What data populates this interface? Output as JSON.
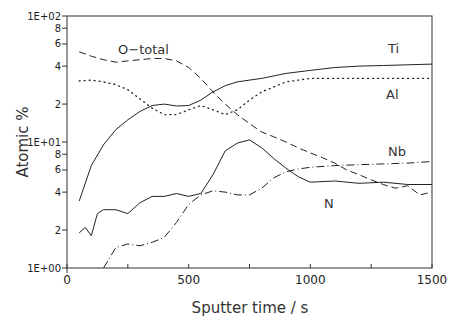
{
  "chart_data": {
    "type": "line",
    "title": "",
    "xlabel": "Sputter time / s",
    "ylabel": "Atomic %",
    "xlim": [
      0,
      1500
    ],
    "ylim": [
      1,
      100
    ],
    "yscale": "log",
    "grid": false,
    "legend": "inline labels",
    "x_ticks": [
      0,
      500,
      1000,
      1500
    ],
    "x_tick_labels": [
      "0",
      "500",
      "1000",
      "1500"
    ],
    "y_ticks": [
      1,
      2,
      4,
      6,
      8,
      10,
      20,
      40,
      60,
      80,
      100
    ],
    "y_tick_labels": [
      "1E+00",
      "2",
      "4",
      "6",
      "8",
      "1E+01",
      "2",
      "4",
      "6",
      "8",
      "1E+02"
    ],
    "series": [
      {
        "name": "O-total",
        "style": "dashed",
        "label_pos": [
          150,
          55
        ],
        "x": [
          50,
          100,
          150,
          200,
          250,
          300,
          350,
          400,
          450,
          500,
          550,
          600,
          650,
          700,
          750,
          800,
          850,
          900,
          950,
          1000,
          1050,
          1100,
          1150,
          1200,
          1250,
          1300,
          1350,
          1400,
          1450,
          1500
        ],
        "values": [
          52,
          48,
          45,
          43,
          44,
          45,
          46,
          46,
          44,
          39,
          32,
          25,
          20,
          16.5,
          14,
          12,
          11,
          10,
          9,
          8.2,
          7.5,
          6.8,
          6,
          5.5,
          5,
          4.6,
          4.3,
          4.5,
          3.8,
          4.0
        ]
      },
      {
        "name": "Ti",
        "style": "solid",
        "label_pos": [
          1340,
          55
        ],
        "x": [
          50,
          100,
          150,
          200,
          250,
          300,
          350,
          400,
          450,
          500,
          550,
          600,
          650,
          700,
          750,
          800,
          900,
          1000,
          1100,
          1200,
          1300,
          1400,
          1500
        ],
        "values": [
          3.4,
          6.5,
          9.5,
          12.5,
          15,
          17.5,
          19.5,
          20,
          19.3,
          19.5,
          21.5,
          25,
          28,
          30,
          31,
          32,
          35,
          37,
          39,
          40,
          40.5,
          41,
          41.5
        ]
      },
      {
        "name": "Al",
        "style": "dotted",
        "label_pos": [
          1340,
          29
        ],
        "x": [
          50,
          100,
          150,
          200,
          250,
          300,
          350,
          400,
          450,
          500,
          550,
          600,
          650,
          700,
          750,
          800,
          900,
          1000,
          1100,
          1200,
          1300,
          1400,
          1500
        ],
        "values": [
          30.5,
          31,
          30,
          28.5,
          26,
          22,
          18.5,
          16.5,
          16.5,
          18,
          19.5,
          18,
          16.5,
          18,
          21.5,
          25,
          30,
          32,
          32,
          32,
          32,
          32,
          32
        ]
      },
      {
        "name": "Nb",
        "style": "solid",
        "label_pos": [
          1350,
          11.5
        ],
        "x": [
          50,
          75,
          100,
          125,
          150,
          200,
          250,
          300,
          350,
          400,
          450,
          500,
          550,
          600,
          650,
          700,
          750,
          800,
          850,
          900,
          950,
          1000,
          1100,
          1200,
          1300,
          1400,
          1500
        ],
        "values": [
          1.9,
          2.1,
          1.8,
          2.7,
          2.9,
          2.9,
          2.7,
          3.3,
          3.7,
          3.7,
          3.9,
          3.7,
          3.9,
          5.5,
          8.5,
          9.8,
          10.4,
          9.0,
          7.4,
          6.2,
          5.3,
          4.8,
          4.9,
          4.7,
          4.8,
          4.6,
          4.6
        ]
      },
      {
        "name": "N",
        "style": "dash-dot",
        "label_pos": [
          1150,
          3.2
        ],
        "x": [
          150,
          175,
          200,
          250,
          300,
          350,
          400,
          450,
          500,
          550,
          600,
          650,
          700,
          750,
          800,
          850,
          900,
          950,
          1000,
          1100,
          1200,
          1300,
          1400,
          1500
        ],
        "values": [
          1.0,
          1.2,
          1.45,
          1.55,
          1.5,
          1.6,
          1.75,
          2.3,
          3.2,
          3.8,
          4.1,
          4.0,
          3.8,
          3.8,
          4.3,
          5.2,
          5.8,
          6.1,
          6.3,
          6.5,
          6.6,
          6.7,
          6.8,
          7.0
        ]
      }
    ]
  },
  "labels": {
    "o_total": "O−total",
    "ti": "Ti",
    "al": "Al",
    "nb": "Nb",
    "n": "N",
    "xlabel": "Sputter time / s",
    "ylabel": "Atomic %"
  }
}
